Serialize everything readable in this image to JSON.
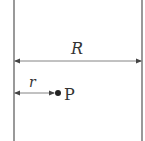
{
  "diagram": {
    "labels": {
      "big_radius": "R",
      "small_radius": "r",
      "point": "P"
    },
    "colors": {
      "line": "#555555",
      "text": "#333333",
      "background": "#ffffff"
    }
  }
}
